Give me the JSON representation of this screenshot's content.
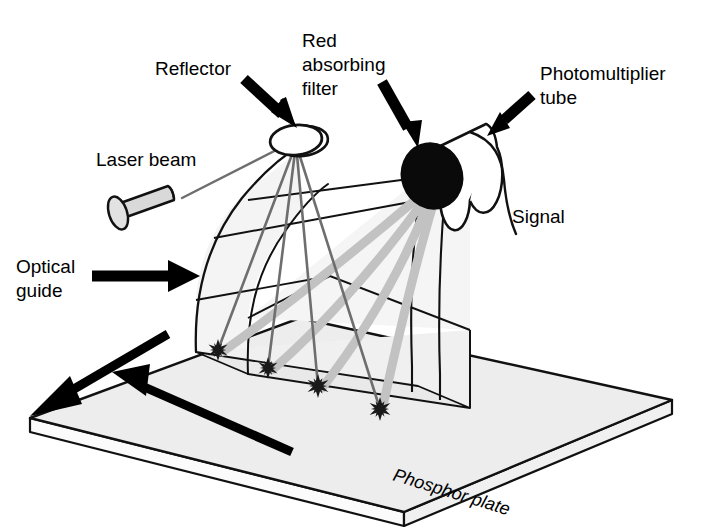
{
  "figure": {
    "background_color": "#ffffff",
    "ink_color": "#111111",
    "ray_color": "#808080",
    "band_color": "#b9b9b9",
    "plate_fill": "#ededed",
    "guide_fill": "#f2f2f2",
    "laser_fill": "#d9d9d9",
    "filter_fill": "#000000"
  },
  "labels": {
    "reflector": "Reflector",
    "red_absorbing_filter_line1": "Red",
    "red_absorbing_filter_line2": "absorbing",
    "red_absorbing_filter_line3": "filter",
    "photomultiplier_line1": "Photomultiplier",
    "photomultiplier_line2": "tube",
    "laser_beam": "Laser beam",
    "signal": "Signal",
    "optical_guide_line1": "Optical",
    "optical_guide_line2": "guide",
    "phosphor_plate": "Phosphor plate"
  },
  "components": {
    "reflector": {
      "name": "Reflector",
      "shape": "ellipse-ring",
      "cx": 296,
      "cy": 140,
      "rx": 26,
      "ry": 15
    },
    "red_absorbing_filter": {
      "name": "Red absorbing filter",
      "shape": "filled-disk",
      "cx": 432,
      "cy": 175,
      "r": 29
    },
    "photomultiplier_tube": {
      "name": "Photomultiplier tube",
      "shape": "cylinder",
      "angle_deg": -28
    },
    "laser_source": {
      "name": "Laser beam source",
      "shape": "cylinder",
      "fill": "#d9d9d9"
    },
    "optical_guide": {
      "name": "Optical guide",
      "shape": "curved-light-guide"
    },
    "phosphor_plate": {
      "name": "Phosphor plate",
      "shape": "parallelogram-slab",
      "fill": "#ededed"
    },
    "signal_cable": {
      "name": "Signal cable",
      "shape": "curved-wire"
    }
  },
  "scan_spots": {
    "count": 4,
    "glyph": "starburst",
    "points": [
      {
        "x": 218,
        "y": 350
      },
      {
        "x": 268,
        "y": 368
      },
      {
        "x": 318,
        "y": 386
      },
      {
        "x": 380,
        "y": 409
      }
    ]
  },
  "motion_arrows": [
    {
      "name": "plate-translation-arrow",
      "direction": "down-left"
    },
    {
      "name": "scan-direction-arrow",
      "direction": "up-left"
    }
  ],
  "callout_arrows": [
    {
      "name": "reflector-callout-arrow",
      "target": "reflector"
    },
    {
      "name": "filter-callout-arrow",
      "target": "red_absorbing_filter"
    },
    {
      "name": "pmt-callout-arrow",
      "target": "photomultiplier_tube"
    },
    {
      "name": "optical-guide-callout-arrow",
      "target": "optical_guide"
    }
  ]
}
